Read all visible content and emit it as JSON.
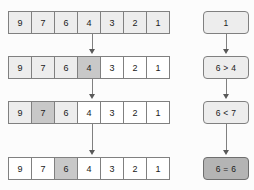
{
  "diagram": {
    "colors": {
      "background": "#fcfcfc",
      "cell_border": "#808080",
      "cell_white": "#ffffff",
      "cell_light": "#ededed",
      "cell_dark": "#c8c8c8",
      "box_light": "#ededed",
      "box_dark": "#b4b4b4",
      "connector": "#808080",
      "text": "#1a1a1a"
    },
    "rows": [
      {
        "name": "row-1",
        "cells": [
          {
            "value": "9",
            "shade": "light"
          },
          {
            "value": "7",
            "shade": "light"
          },
          {
            "value": "6",
            "shade": "light"
          },
          {
            "value": "4",
            "shade": "light"
          },
          {
            "value": "3",
            "shade": "light"
          },
          {
            "value": "2",
            "shade": "light"
          },
          {
            "value": "1",
            "shade": "light"
          }
        ]
      },
      {
        "name": "row-2",
        "cells": [
          {
            "value": "9",
            "shade": "light"
          },
          {
            "value": "7",
            "shade": "light"
          },
          {
            "value": "6",
            "shade": "light"
          },
          {
            "value": "4",
            "shade": "dark"
          },
          {
            "value": "3",
            "shade": "white"
          },
          {
            "value": "2",
            "shade": "white"
          },
          {
            "value": "1",
            "shade": "white"
          }
        ]
      },
      {
        "name": "row-3",
        "cells": [
          {
            "value": "9",
            "shade": "light"
          },
          {
            "value": "7",
            "shade": "dark"
          },
          {
            "value": "6",
            "shade": "light"
          },
          {
            "value": "4",
            "shade": "white"
          },
          {
            "value": "3",
            "shade": "white"
          },
          {
            "value": "2",
            "shade": "white"
          },
          {
            "value": "1",
            "shade": "white"
          }
        ]
      },
      {
        "name": "row-4",
        "cells": [
          {
            "value": "9",
            "shade": "white"
          },
          {
            "value": "7",
            "shade": "white"
          },
          {
            "value": "6",
            "shade": "dark"
          },
          {
            "value": "4",
            "shade": "white"
          },
          {
            "value": "3",
            "shade": "white"
          },
          {
            "value": "2",
            "shade": "white"
          },
          {
            "value": "1",
            "shade": "white"
          }
        ]
      }
    ],
    "decision_boxes": [
      {
        "name": "box-1",
        "label": "1",
        "shade": "light"
      },
      {
        "name": "box-2",
        "label": "6 > 4",
        "shade": "light"
      },
      {
        "name": "box-3",
        "label": "6 < 7",
        "shade": "light"
      },
      {
        "name": "box-4",
        "label": "6 = 6",
        "shade": "dark"
      }
    ]
  }
}
